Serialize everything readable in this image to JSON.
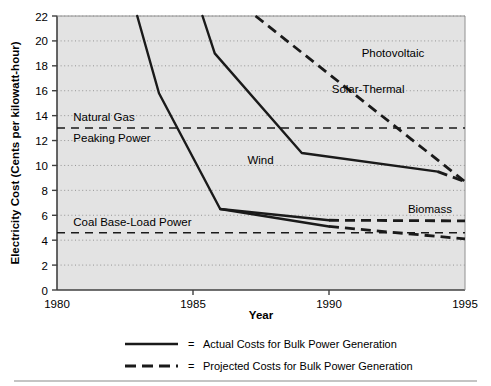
{
  "figure": {
    "background_color": "#ffffff",
    "plot_background_color": "#e3e3e3",
    "line_color": "#1a1a1a",
    "grid_color": "#8c8c8c",
    "border_color": "#595959"
  },
  "chart_data": {
    "type": "line",
    "title": "",
    "xlabel": "Year",
    "ylabel": "Electricity Cost (Cents per kilowatt-hour)",
    "xlim": [
      1980,
      1995
    ],
    "ylim": [
      0,
      22
    ],
    "xticks": [
      1980,
      1985,
      1990,
      1995
    ],
    "yticks": [
      0,
      2,
      4,
      6,
      8,
      10,
      12,
      14,
      16,
      18,
      20,
      22
    ],
    "xtick_labels": [
      "1980",
      "1985",
      "1990",
      "1995"
    ],
    "ytick_labels": [
      "0",
      "2",
      "4",
      "6",
      "8",
      "10",
      "12",
      "14",
      "16",
      "18",
      "20",
      "22"
    ],
    "grid": true,
    "grid_axis": "y",
    "legend_position": "below-plot",
    "series": [
      {
        "name": "Wind",
        "label": "Wind",
        "label_x": 1987.0,
        "label_y": 10.4,
        "style": "mixed",
        "actual_points": [
          [
            1982.95,
            22.0
          ],
          [
            1983.75,
            15.8
          ],
          [
            1986.0,
            6.5
          ],
          [
            1990.0,
            5.1
          ],
          [
            1990.0,
            5.1
          ]
        ],
        "projected_points": [
          [
            1990.0,
            5.1
          ],
          [
            1995.0,
            4.1
          ]
        ]
      },
      {
        "name": "Solar-Thermal",
        "label": "Solar-Thermal",
        "label_x": 1990.1,
        "label_y": 16.1,
        "style": "mixed",
        "actual_points": [
          [
            1985.35,
            22.0
          ],
          [
            1985.8,
            19.0
          ],
          [
            1989.0,
            11.0
          ],
          [
            1994.0,
            9.5
          ]
        ],
        "projected_points": [
          [
            1994.0,
            9.5
          ],
          [
            1995.0,
            8.7
          ]
        ]
      },
      {
        "name": "Photovoltaic",
        "label": "Photovoltaic",
        "label_x": 1991.2,
        "label_y": 19.0,
        "style": "projected",
        "actual_points": [],
        "projected_points": [
          [
            1987.3,
            22.0
          ],
          [
            1995.0,
            8.7
          ]
        ]
      },
      {
        "name": "Biomass",
        "label": "Biomass",
        "label_x": 1992.9,
        "label_y": 6.5,
        "style": "mixed",
        "actual_points": [
          [
            1986.0,
            6.5
          ],
          [
            1990.0,
            5.6
          ]
        ],
        "projected_points": [
          [
            1990.0,
            5.6
          ],
          [
            1995.0,
            5.55
          ]
        ]
      },
      {
        "name": "Natural Gas Peaking Power",
        "label_lines": [
          "Natural Gas",
          "Peaking Power"
        ],
        "label_x": 1980.6,
        "label_y_line1": 13.9,
        "label_y_line2": 12.2,
        "style": "reference-dashed",
        "value": 13.0,
        "actual_points": [],
        "projected_points": [
          [
            1980.0,
            13.0
          ],
          [
            1995.0,
            13.0
          ]
        ]
      },
      {
        "name": "Coal Base-Load Power",
        "label": "Coal Base-Load Power",
        "label_x": 1980.6,
        "label_y": 5.45,
        "style": "reference-dashed",
        "value": 4.6,
        "actual_points": [],
        "projected_points": [
          [
            1980.0,
            4.6
          ],
          [
            1995.0,
            4.6
          ]
        ]
      }
    ]
  },
  "legend": {
    "entries": [
      {
        "swatch": "solid-line-swatch",
        "equals": "=",
        "text": "Actual Costs for Bulk Power Generation"
      },
      {
        "swatch": "dashed-line-swatch",
        "equals": "=",
        "text": "Projected Costs for Bulk Power Generation"
      }
    ]
  }
}
